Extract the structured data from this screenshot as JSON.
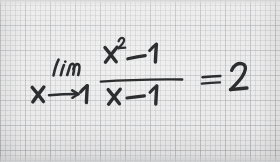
{
  "image": {
    "subject": "handwritten-limit-equation",
    "medium": "black marker on light gray graph paper",
    "width": 280,
    "height": 162
  },
  "paper": {
    "background_color": "#e8e8e8",
    "grid_line_color": "#9698 9c",
    "grid_fine_spacing_px": 5,
    "grid_major_spacing_px": 25,
    "edge_shadow_color": "#cdced0"
  },
  "handwriting": {
    "ink_color": "#2b2c2e",
    "full_expression": "lim x→1 (x² − 1)/(x − 1) = 2",
    "limit_operator": "lim",
    "limit_variable": "x",
    "limit_arrow": "⟶",
    "limit_target": "1",
    "numerator": "x² − 1",
    "numerator_base": "x",
    "numerator_exponent": "2",
    "numerator_minus": "−",
    "numerator_constant": "1",
    "fraction_bar": "―――――",
    "denominator": "x − 1",
    "denominator_base": "x",
    "denominator_minus": "−",
    "denominator_constant": "1",
    "equals_sign": "=",
    "result": "2"
  }
}
